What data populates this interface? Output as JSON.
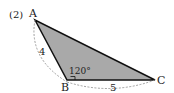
{
  "problem_number": "(2)",
  "vertices": {
    "A": {
      "label": "A"
    },
    "B": {
      "label": "B"
    },
    "C": {
      "label": "C"
    }
  },
  "measurements": {
    "side_AB": "4",
    "side_BC": "5",
    "angle_B": "120°"
  },
  "colors": {
    "fill": "#a9a9a9",
    "stroke": "#111111",
    "dashed": "#888888",
    "text": "#222222"
  }
}
